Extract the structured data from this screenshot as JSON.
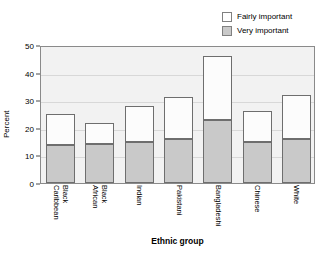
{
  "chart_data": {
    "type": "bar",
    "subtype": "stacked-bar",
    "title": "",
    "xlabel": "Ethnic group",
    "ylabel": "Percent",
    "ylim": [
      0,
      50
    ],
    "yticks": [
      0,
      10,
      20,
      30,
      40,
      50
    ],
    "ytick_labels": [
      "0",
      "10",
      "20",
      "30",
      "40",
      "50"
    ],
    "grid": true,
    "legend_position": "top-right",
    "categories": [
      "Black Caribbean",
      "Black African",
      "Indian",
      "Pakistani",
      "Bangladeshi",
      "Chinese",
      "White"
    ],
    "category_lines": [
      [
        "Black",
        "Caribbean"
      ],
      [
        "Black",
        "African"
      ],
      [
        "Indian"
      ],
      [
        "Pakistani"
      ],
      [
        "Bangladeshi"
      ],
      [
        "Chinese"
      ],
      [
        "White"
      ]
    ],
    "series": [
      {
        "name": "Very important",
        "color": "#c9c9c9",
        "values": [
          13.7,
          14.0,
          15.0,
          16.0,
          23.0,
          15.0,
          16.0
        ]
      },
      {
        "name": "Fairly important",
        "color": "#ffffff",
        "values": [
          11.3,
          7.7,
          13.0,
          15.0,
          23.0,
          11.0,
          16.0
        ]
      }
    ],
    "totals": [
      25.0,
      21.7,
      28.0,
      31.0,
      46.0,
      26.0,
      32.0
    ]
  },
  "legend": {
    "items": [
      {
        "label": "Fairly important",
        "swatch": "white-swatch"
      },
      {
        "label": "Very important",
        "swatch": "gray-swatch"
      }
    ]
  },
  "axes": {
    "y_title": "Percent",
    "x_title": "Ethnic group"
  },
  "colors": {
    "plot_background": "#f2f2f2",
    "gridline": "#d8d8d8",
    "frame": "#8a8a8a",
    "bar_outline": "#6e6e6e",
    "very_important": "#c9c9c9",
    "fairly_important": "#ffffff",
    "text": "#000000"
  }
}
